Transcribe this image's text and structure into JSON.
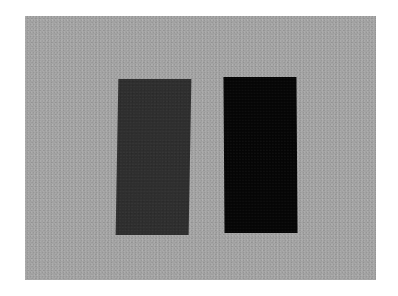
{
  "scene": {
    "description": "Two dark rectangles on a grainy gray background",
    "background_color": "#a3a3a3",
    "border_color": "#ffffff",
    "rectangles": [
      {
        "name": "left",
        "color": "#2e2e2e"
      },
      {
        "name": "right",
        "color": "#050505"
      }
    ]
  }
}
